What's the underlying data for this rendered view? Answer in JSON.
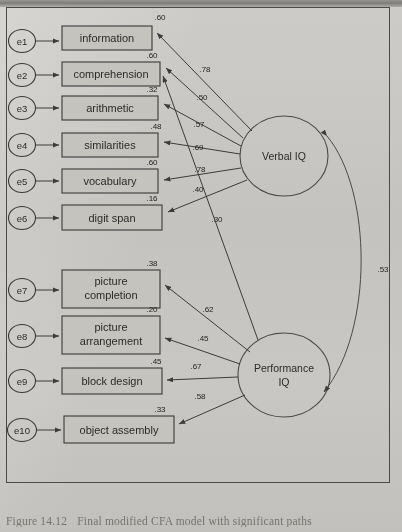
{
  "figure": {
    "caption_number": "Figure 14.12",
    "caption_text": "Final modified CFA model with significant paths"
  },
  "diagram": {
    "type": "confirmatory-factor-analysis-path-diagram",
    "latent_factors": [
      {
        "id": "verbal",
        "label_line1": "Verbal IQ",
        "label_line2": ""
      },
      {
        "id": "performance",
        "label_line1": "Performance",
        "label_line2": "IQ"
      }
    ],
    "factor_correlation": {
      "between": [
        "Verbal IQ",
        "Performance IQ"
      ],
      "value": ".53"
    },
    "indicators": [
      {
        "error": "e1",
        "label": "information",
        "label2": "",
        "variance": ".60",
        "loading": ".78",
        "factor": "Verbal IQ"
      },
      {
        "error": "e2",
        "label": "comprehension",
        "label2": "",
        "variance": ".60",
        "loading": ".50",
        "factor": "Verbal IQ"
      },
      {
        "error": "e3",
        "label": "arithmetic",
        "label2": "",
        "variance": ".32",
        "loading": ".57",
        "factor": "Verbal IQ"
      },
      {
        "error": "e4",
        "label": "similarities",
        "label2": "",
        "variance": ".48",
        "loading": ".69",
        "factor": "Verbal IQ"
      },
      {
        "error": "e5",
        "label": "vocabulary",
        "label2": "",
        "variance": ".60",
        "loading": ".78",
        "factor": "Verbal IQ"
      },
      {
        "error": "e6",
        "label": "digit span",
        "label2": "",
        "variance": ".16",
        "loading": ".40",
        "factor": "Verbal IQ"
      },
      {
        "error": "e7",
        "label": "picture",
        "label2": "completion",
        "variance": ".38",
        "loading": ".62",
        "factor": "Performance IQ"
      },
      {
        "error": "e8",
        "label": "picture",
        "label2": "arrangement",
        "variance": ".20",
        "loading": ".45",
        "factor": "Performance IQ"
      },
      {
        "error": "e9",
        "label": "block design",
        "label2": "",
        "variance": ".45",
        "loading": ".67",
        "factor": "Performance IQ"
      },
      {
        "error": "e10",
        "label": "object assembly",
        "label2": "",
        "variance": ".33",
        "loading": ".58",
        "factor": "Performance IQ"
      }
    ],
    "cross_loading": {
      "from": "Performance IQ",
      "to": "digit span",
      "value": ".30"
    }
  }
}
